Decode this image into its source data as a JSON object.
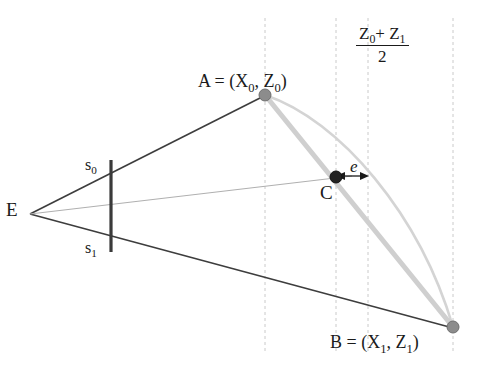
{
  "diagram": {
    "canvas": {
      "width": 480,
      "height": 376,
      "background": "#ffffff"
    },
    "colors": {
      "ray_dark": "#3d3d3d",
      "edge_light": "#c9c9c9",
      "arc_light": "#d2d2d2",
      "center_ray": "#b5b5b5",
      "dashed": "#cccccc",
      "vertex_gray": "#8c8c8c",
      "point_dark": "#1a1a1a",
      "image_plane": "#3a3a3a",
      "text": "#1a1a1a"
    },
    "labels": {
      "eye": "E",
      "scanline_top": "s",
      "scanline_top_sub": "0",
      "scanline_bottom": "s",
      "scanline_bottom_sub": "1",
      "point_a_name": "A",
      "point_a_eq": " = (",
      "point_a_x": "X",
      "point_a_x_sub": "0",
      "point_a_sep": ", ",
      "point_a_z": "Z",
      "point_a_z_sub": "0",
      "point_a_close": ")",
      "point_b_name": "B",
      "point_b_eq": " = (",
      "point_b_x": "X",
      "point_b_x_sub": "1",
      "point_b_sep": ", ",
      "point_b_z": "Z",
      "point_b_z_sub": "1",
      "point_b_close": ")",
      "point_c": "C",
      "error": "e",
      "midpoint_numer_z0": "Z",
      "midpoint_numer_z0_sub": "0",
      "midpoint_numer_plus": "+ ",
      "midpoint_numer_z1": "Z",
      "midpoint_numer_z1_sub": "1",
      "midpoint_denom": "2"
    },
    "geometry": {
      "eye": {
        "x": 30,
        "y": 214
      },
      "point_a": {
        "x": 265,
        "y": 95
      },
      "point_b": {
        "x": 453,
        "y": 327
      },
      "point_c": {
        "x": 336,
        "y": 178
      },
      "image_plane": {
        "x": 111,
        "y_top": 160,
        "y_bottom": 252
      },
      "s0": {
        "x": 111,
        "y": 170
      },
      "s1": {
        "x": 111,
        "y": 244
      },
      "dashed_lines_x": [
        265,
        336,
        368,
        453
      ],
      "dashed_y_top": 18,
      "dashed_y_bottom": 352,
      "error_arrow": {
        "x_start": 344,
        "x_end": 368,
        "y": 176
      }
    }
  }
}
